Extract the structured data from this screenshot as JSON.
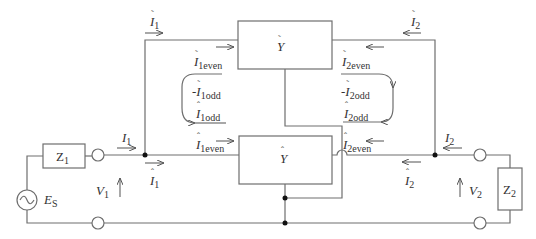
{
  "diagram": {
    "type": "circuit",
    "blocks": {
      "top_block": {
        "symbol": "Y",
        "accent": "tilde"
      },
      "bottom_block": {
        "symbol": "Y",
        "accent": "hat"
      },
      "z1": {
        "symbol": "Z",
        "sub": "1"
      },
      "z2": {
        "symbol": "Z",
        "sub": "2"
      }
    },
    "source": {
      "symbol": "E",
      "sub": "S"
    },
    "voltages": {
      "v1": {
        "symbol": "V",
        "sub": "1"
      },
      "v2": {
        "symbol": "V",
        "sub": "2"
      }
    },
    "currents": {
      "i1": {
        "symbol": "I",
        "sub": "1"
      },
      "i2": {
        "symbol": "I",
        "sub": "2"
      },
      "i1_tilde": {
        "symbol": "I",
        "sub": "1"
      },
      "i2_tilde": {
        "symbol": "I",
        "sub": "2"
      },
      "i1_hat": {
        "symbol": "I",
        "sub": "1"
      },
      "i2_hat": {
        "symbol": "I",
        "sub": "2"
      },
      "i1even_tilde": {
        "symbol": "I",
        "sub": "1even"
      },
      "i2even_tilde": {
        "symbol": "I",
        "sub": "2even"
      },
      "i1odd_tilde": {
        "prefix": "-",
        "symbol": "I",
        "sub": "1odd"
      },
      "i2odd_tilde": {
        "prefix": "-",
        "symbol": "I",
        "sub": "2odd"
      },
      "i1odd_hat": {
        "symbol": "I",
        "sub": "1odd"
      },
      "i2odd_hat": {
        "symbol": "I",
        "sub": "2odd"
      },
      "i1even_hat": {
        "symbol": "I",
        "sub": "1even"
      },
      "i2even_hat": {
        "symbol": "I",
        "sub": "2even"
      }
    }
  }
}
